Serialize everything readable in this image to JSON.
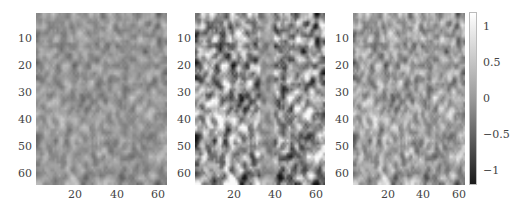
{
  "chart_data": {
    "type": "heatmap",
    "title": "",
    "panels": [
      {
        "name": "panel-1",
        "description": "low-contrast noise field, mostly mid-gray",
        "contrast": 0.35,
        "xlim": [
          1,
          64
        ],
        "ylim": [
          1,
          64
        ],
        "xticks": [
          20,
          40,
          60
        ],
        "yticks": [
          10,
          20,
          30,
          40,
          50,
          60
        ]
      },
      {
        "name": "panel-2",
        "description": "high-contrast noise field with vertical stripe near x=33-40",
        "contrast": 1.0,
        "xlim": [
          1,
          64
        ],
        "ylim": [
          1,
          64
        ],
        "xticks": [
          20,
          40,
          60
        ],
        "yticks": [
          10,
          20,
          30,
          40,
          50,
          60
        ]
      },
      {
        "name": "panel-3",
        "description": "medium-contrast noise field, slightly lighter",
        "contrast": 0.55,
        "xlim": [
          1,
          64
        ],
        "ylim": [
          1,
          64
        ],
        "xticks": [
          20,
          40,
          60
        ],
        "yticks": [
          10,
          20,
          30,
          40,
          50,
          60
        ]
      }
    ],
    "colorbar": {
      "min": -1.2,
      "max": 1.2,
      "ticks": [
        1,
        0.5,
        0,
        -0.5,
        -1
      ],
      "colormap": "gray"
    },
    "grid": false,
    "legend": null
  },
  "labels": {
    "yticks": [
      "10",
      "20",
      "30",
      "40",
      "50",
      "60"
    ],
    "xticks": [
      "20",
      "40",
      "60"
    ],
    "cbar_ticks": [
      "1",
      "0.5",
      "0",
      "−0.5",
      "−1"
    ]
  }
}
